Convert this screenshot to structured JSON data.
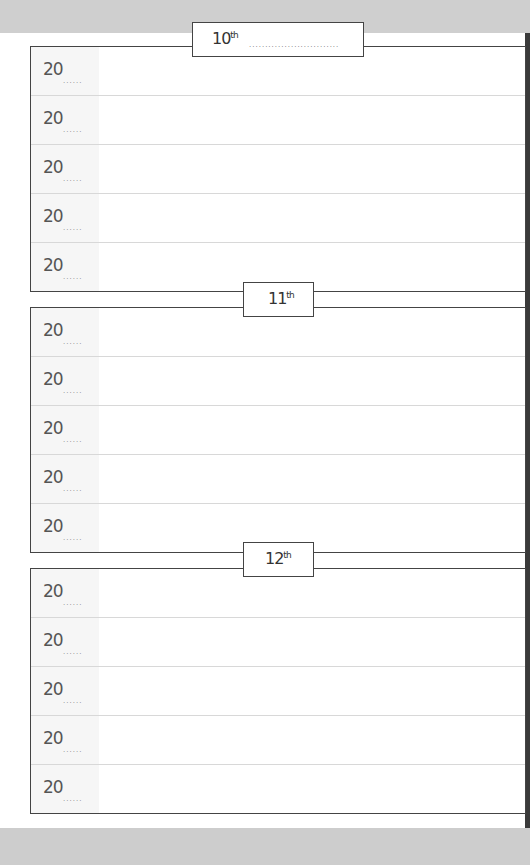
{
  "days": [
    {
      "label": "10",
      "suffix": "th",
      "dotted_line": "............................",
      "rows": [
        {
          "year": "20",
          "dots": "......"
        },
        {
          "year": "20",
          "dots": "......"
        },
        {
          "year": "20",
          "dots": "......"
        },
        {
          "year": "20",
          "dots": "......"
        },
        {
          "year": "20",
          "dots": "......"
        }
      ]
    },
    {
      "label": "11",
      "suffix": "th",
      "rows": [
        {
          "year": "20",
          "dots": "......"
        },
        {
          "year": "20",
          "dots": "......"
        },
        {
          "year": "20",
          "dots": "......"
        },
        {
          "year": "20",
          "dots": "......"
        },
        {
          "year": "20",
          "dots": "......"
        }
      ]
    },
    {
      "label": "12",
      "suffix": "th",
      "rows": [
        {
          "year": "20",
          "dots": "......"
        },
        {
          "year": "20",
          "dots": "......"
        },
        {
          "year": "20",
          "dots": "......"
        },
        {
          "year": "20",
          "dots": "......"
        },
        {
          "year": "20",
          "dots": "......"
        }
      ]
    }
  ]
}
